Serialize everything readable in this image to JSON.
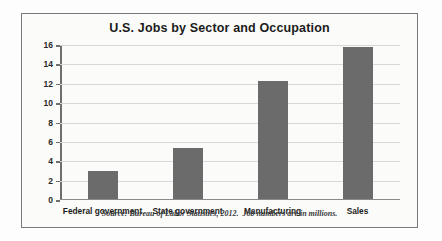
{
  "chart_data": {
    "type": "bar",
    "title": "U.S. Jobs by Sector and Occupation",
    "xlabel": "",
    "ylabel": "",
    "categories": [
      "Federal government",
      "State government",
      "Manufacturing",
      "Sales"
    ],
    "values": [
      2.8,
      5.2,
      12.1,
      15.6
    ],
    "ylim": [
      0,
      16
    ],
    "yticks": [
      0,
      2,
      4,
      6,
      8,
      10,
      12,
      14,
      16
    ],
    "ytick_labels": [
      "0",
      "2",
      "4",
      "6",
      "8",
      "10",
      "12",
      "14",
      "16"
    ],
    "grid": true,
    "legend": false,
    "bar_color": "#6b6b6b",
    "gridline_color": "#d8d8d8",
    "axis_color": "#6e6e6e",
    "note": "Source: Bureau of Labor Statistics, 2012.  Job numbers are in millions."
  }
}
